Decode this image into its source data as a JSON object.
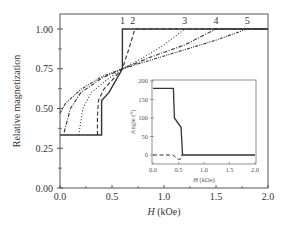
{
  "chart_data": [
    {
      "type": "line",
      "role": "main",
      "title": "",
      "xlabel": "H (kOe)",
      "xlabel_var": "H",
      "xlabel_unit": " (kOe)",
      "ylabel": "Relative magnetization",
      "xlim": [
        0.0,
        2.0
      ],
      "ylim": [
        0.0,
        1.1
      ],
      "xticks": [
        "0.0",
        "0.5",
        "1.0",
        "1.5",
        "2.0"
      ],
      "yticks": [
        "0.00",
        "0.25",
        "0.50",
        "0.75",
        "1.00"
      ],
      "grid": false,
      "legend": "curve numbers labeled at top of plot (1-5)",
      "series": [
        {
          "name": "1",
          "style": "solid",
          "x": [
            0.0,
            0.4,
            0.4,
            0.47,
            0.6,
            0.6,
            2.0
          ],
          "y": [
            0.333,
            0.333,
            0.55,
            0.6,
            0.75,
            1.0,
            1.0
          ]
        },
        {
          "name": "2",
          "style": "dashed",
          "x": [
            0.36,
            0.36,
            0.37,
            0.42,
            0.6,
            0.66,
            0.72,
            2.0
          ],
          "y": [
            0.333,
            0.45,
            0.55,
            0.62,
            0.75,
            0.87,
            1.0,
            1.0
          ]
        },
        {
          "name": "3",
          "style": "dotted",
          "x": [
            0.18,
            0.22,
            0.3,
            0.45,
            0.6,
            0.8,
            1.0,
            1.2,
            2.0
          ],
          "y": [
            0.333,
            0.5,
            0.6,
            0.68,
            0.75,
            0.82,
            0.9,
            1.0,
            1.0
          ]
        },
        {
          "name": "4",
          "style": "dash-dot",
          "x": [
            0.04,
            0.1,
            0.2,
            0.4,
            0.6,
            0.9,
            1.2,
            1.5,
            2.0
          ],
          "y": [
            0.35,
            0.5,
            0.6,
            0.69,
            0.75,
            0.83,
            0.9,
            1.0,
            1.0
          ]
        },
        {
          "name": "5",
          "style": "dash-dot-dot",
          "x": [
            0.0,
            0.05,
            0.2,
            0.4,
            0.6,
            0.9,
            1.2,
            1.5,
            1.8,
            2.0
          ],
          "y": [
            0.47,
            0.53,
            0.62,
            0.7,
            0.75,
            0.81,
            0.87,
            0.93,
            1.0,
            1.0
          ]
        }
      ],
      "annotations": [
        "1",
        "2",
        "3",
        "4",
        "5"
      ]
    },
    {
      "type": "line",
      "role": "inset",
      "title": "",
      "xlabel": "H (kOe)",
      "xlabel_var": "H",
      "xlabel_unit": " (kOe)",
      "ylabel": "Angle (°)",
      "xlim": [
        0.0,
        2.0
      ],
      "ylim": [
        -20,
        200
      ],
      "xticks": [
        "0.0",
        "0.5",
        "1.0",
        "1.5",
        "2.0"
      ],
      "yticks": [
        "0",
        "50",
        "100",
        "150",
        "200"
      ],
      "grid": false,
      "series": [
        {
          "name": "solid",
          "style": "solid",
          "x": [
            0.0,
            0.4,
            0.42,
            0.55,
            0.58,
            0.6,
            2.0
          ],
          "y": [
            180,
            180,
            100,
            75,
            0,
            0,
            0
          ]
        },
        {
          "name": "dashed",
          "style": "dashed",
          "x": [
            0.0,
            0.4,
            0.45,
            0.5,
            0.55,
            0.58
          ],
          "y": [
            0,
            0,
            -8,
            -12,
            -10,
            5
          ]
        }
      ]
    }
  ]
}
